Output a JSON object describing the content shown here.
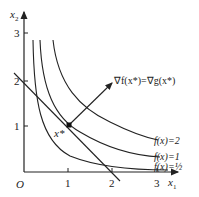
{
  "diagram": {
    "axes": {
      "x_label": "x",
      "x_sub": "1",
      "y_label": "x",
      "y_sub": "2",
      "origin_label": "O",
      "x_ticks": [
        "1",
        "2",
        "3"
      ],
      "y_ticks": [
        "1",
        "2",
        "3"
      ]
    },
    "point": {
      "label": "x*",
      "coords": [
        1,
        1
      ]
    },
    "gradient_label": "∇f(x*)=∇g(x*)",
    "level_curves": [
      {
        "label": "f(x)=2",
        "c": 2
      },
      {
        "label": "f(x)=1",
        "c": 1
      },
      {
        "label": "f(x)=½",
        "c": 0.5
      }
    ],
    "constraint_line": "x1 + x2 = 2",
    "colors": {
      "stroke": "#222222",
      "background": "#ffffff"
    }
  }
}
